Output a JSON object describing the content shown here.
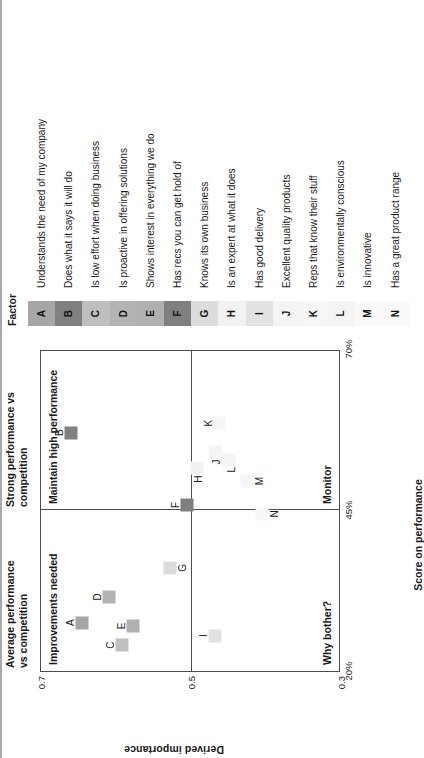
{
  "chart_data": {
    "type": "scatter",
    "title": "",
    "xlabel": "Score on performance",
    "ylabel": "Derived importance",
    "xlim": [
      20,
      70
    ],
    "ylim": [
      0.3,
      0.7
    ],
    "xticks": [
      "20%",
      "45%",
      "70%"
    ],
    "xtick_values": [
      20,
      45,
      70
    ],
    "yticks": [
      "0.3",
      "0.5",
      "0.7"
    ],
    "ytick_values": [
      0.3,
      0.5,
      0.7
    ],
    "grid": false,
    "legend_position": "right-table",
    "quadrant_divider_x": 45,
    "quadrant_divider_y": 0.5,
    "quadrant_labels": [
      {
        "key": "improvements_needed",
        "text": "Improvements needed"
      },
      {
        "key": "maintain_high_performance",
        "text": "Maintain high performance"
      },
      {
        "key": "why_bother",
        "text": "Why bother?"
      },
      {
        "key": "monitor",
        "text": "Monitor"
      }
    ],
    "column_headers": [
      {
        "key": "average_performance",
        "line1": "Average performance",
        "line2": "vs competition"
      },
      {
        "key": "strong_performance",
        "line1": "Strong performance vs",
        "line2": "competition"
      }
    ],
    "points": [
      {
        "label": "A",
        "x": 27.5,
        "y": 0.645,
        "color": "#a6a6a6"
      },
      {
        "label": "B",
        "x": 57.0,
        "y": 0.66,
        "color": "#808080"
      },
      {
        "label": "C",
        "x": 24.0,
        "y": 0.592,
        "color": "#bfbfbf"
      },
      {
        "label": "D",
        "x": 31.5,
        "y": 0.61,
        "color": "#b3b3b3"
      },
      {
        "label": "E",
        "x": 27.0,
        "y": 0.578,
        "color": "#b0b0b0"
      },
      {
        "label": "F",
        "x": 45.8,
        "y": 0.505,
        "color": "#7f7f7f"
      },
      {
        "label": "G",
        "x": 36.0,
        "y": 0.528,
        "color": "#dcdcdc"
      },
      {
        "label": "H",
        "x": 51.5,
        "y": 0.492,
        "color": "#f1f1f1"
      },
      {
        "label": "I",
        "x": 25.5,
        "y": 0.468,
        "color": "#e2e2e2"
      },
      {
        "label": "J",
        "x": 54.0,
        "y": 0.468,
        "color": "#f4f4f4"
      },
      {
        "label": "K",
        "x": 58.5,
        "y": 0.463,
        "color": "#f6f6f6"
      },
      {
        "label": "L",
        "x": 52.8,
        "y": 0.449,
        "color": "#f4f4f4"
      },
      {
        "label": "M",
        "x": 49.5,
        "y": 0.425,
        "color": "#f7f7f7"
      },
      {
        "label": "N",
        "x": 44.4,
        "y": 0.405,
        "color": "#f7f7f7"
      }
    ]
  },
  "legend": {
    "title": "Factor",
    "rows": [
      {
        "key": "A",
        "color": "#a6a6a6",
        "text": "Understands the need of my company"
      },
      {
        "key": "B",
        "color": "#808080",
        "text": "Does what it says it will do"
      },
      {
        "key": "C",
        "color": "#bfbfbf",
        "text": "Is low effort when doing business"
      },
      {
        "key": "D",
        "color": "#b3b3b3",
        "text": "Is proactive in offering solutions"
      },
      {
        "key": "E",
        "color": "#b0b0b0",
        "text": "Shows interest in everything we do"
      },
      {
        "key": "F",
        "color": "#7f7f7f",
        "text": "Has recs you can get hold of"
      },
      {
        "key": "G",
        "color": "#dcdcdc",
        "text": "Knows its own business"
      },
      {
        "key": "H",
        "color": "#f1f1f1",
        "text": "Is an expert at what it does"
      },
      {
        "key": "I",
        "color": "#e2e2e2",
        "text": "Has good delivery"
      },
      {
        "key": "J",
        "color": "#f4f4f4",
        "text": "Excellent quality products"
      },
      {
        "key": "K",
        "color": "#f6f6f6",
        "text": "Reps that know their stuff"
      },
      {
        "key": "L",
        "color": "#f4f4f4",
        "text": "Is environmentally conscious"
      },
      {
        "key": "M",
        "color": "#f9f9f9",
        "text": "Is innovative"
      },
      {
        "key": "N",
        "color": "#f9f9f9",
        "text": "Has a great product range"
      }
    ]
  }
}
